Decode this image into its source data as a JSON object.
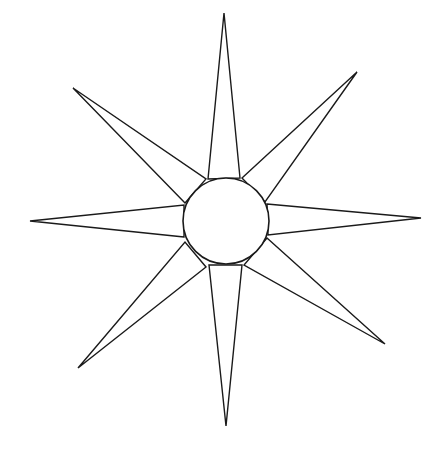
{
  "figure": {
    "type": "eight-pointed star",
    "width": 448,
    "height": 454,
    "background_color": "#ffffff",
    "stroke_color": "#1a1a1a",
    "fill_color": "#ffffff",
    "center_circle": {
      "cx": 226,
      "cy": 221,
      "r": 43
    },
    "rays": [
      {
        "name": "north",
        "tip": [
          224,
          13
        ],
        "base": [
          [
            208,
            179
          ],
          [
            240,
            178
          ]
        ]
      },
      {
        "name": "north-east",
        "tip": [
          357,
          72
        ],
        "base": [
          [
            242,
            178
          ],
          [
            265,
            202
          ]
        ]
      },
      {
        "name": "east",
        "tip": [
          421,
          218
        ],
        "base": [
          [
            267,
            204
          ],
          [
            268,
            235
          ]
        ]
      },
      {
        "name": "south-east",
        "tip": [
          385,
          344
        ],
        "base": [
          [
            267,
            238
          ],
          [
            244,
            265
          ]
        ]
      },
      {
        "name": "south",
        "tip": [
          226,
          426
        ],
        "base": [
          [
            242,
            265
          ],
          [
            209,
            265
          ]
        ]
      },
      {
        "name": "south-west",
        "tip": [
          78,
          368
        ],
        "base": [
          [
            206,
            267
          ],
          [
            185,
            242
          ]
        ]
      },
      {
        "name": "west",
        "tip": [
          30,
          221
        ],
        "base": [
          [
            184,
            237
          ],
          [
            184,
            205
          ]
        ]
      },
      {
        "name": "north-west",
        "tip": [
          73,
          88
        ],
        "base": [
          [
            185,
            203
          ],
          [
            206,
            179
          ]
        ]
      }
    ]
  }
}
